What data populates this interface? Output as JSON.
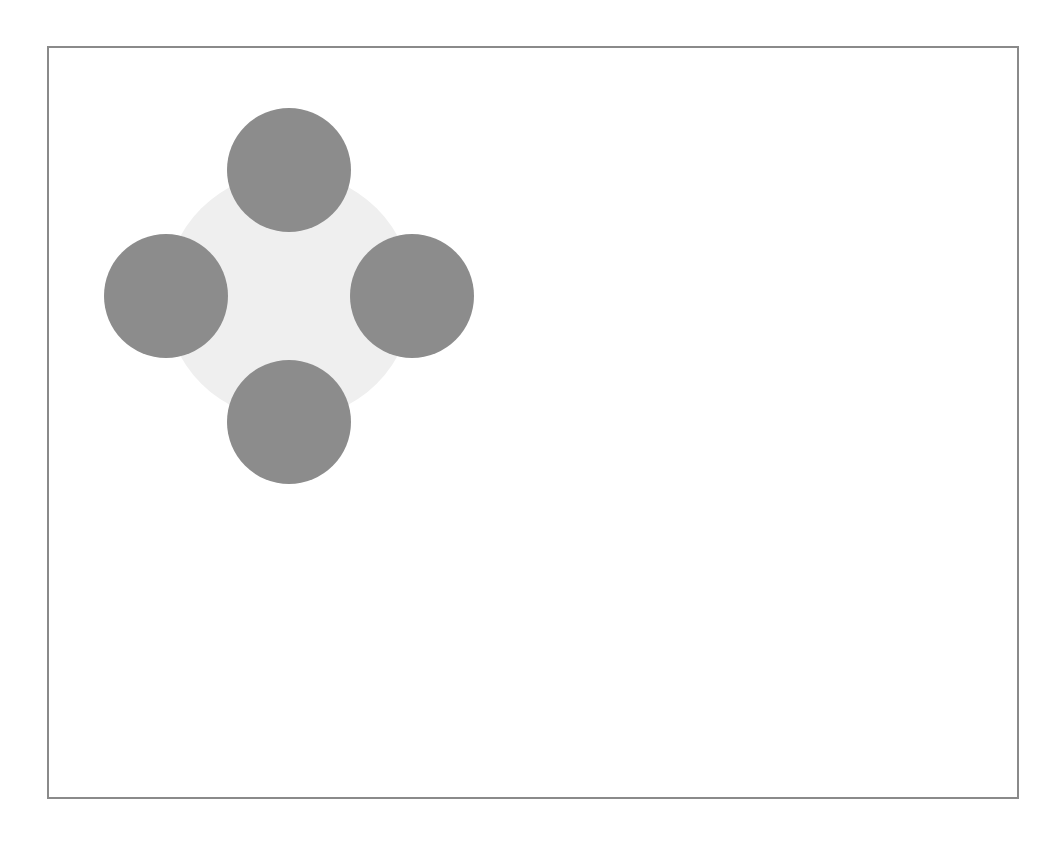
{
  "canvas": {
    "frame": {
      "left": 47,
      "top": 46,
      "right": 1017,
      "bottom": 797,
      "border_color": "#8a8a8a"
    },
    "background_color": "#ffffff"
  },
  "diagram": {
    "center_circle": {
      "cx": 289,
      "cy": 296,
      "r": 124,
      "color": "#efefef"
    },
    "satellites": [
      {
        "name": "top",
        "cx": 289,
        "cy": 170,
        "r": 62,
        "color": "#8c8c8c"
      },
      {
        "name": "left",
        "cx": 166,
        "cy": 296,
        "r": 62,
        "color": "#8c8c8c"
      },
      {
        "name": "right",
        "cx": 412,
        "cy": 296,
        "r": 62,
        "color": "#8c8c8c"
      },
      {
        "name": "bottom",
        "cx": 289,
        "cy": 422,
        "r": 62,
        "color": "#8c8c8c"
      }
    ]
  }
}
